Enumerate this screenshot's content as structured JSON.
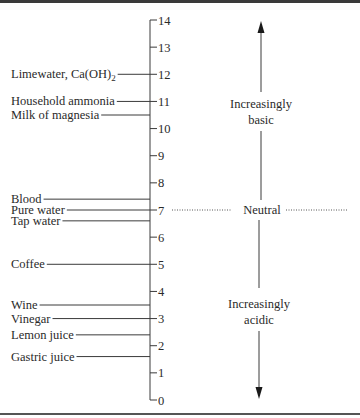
{
  "diagram": {
    "scale": {
      "min": 0,
      "max": 14,
      "ticks": [
        "14",
        "13",
        "12",
        "11",
        "10",
        "9",
        "8",
        "7",
        "6",
        "5",
        "4",
        "3",
        "2",
        "1",
        "0"
      ]
    },
    "substances": [
      {
        "name": "Limewater, Ca(OH)",
        "subscript": "2",
        "ph": 12
      },
      {
        "name": "Household ammonia",
        "ph": 11
      },
      {
        "name": "Milk of magnesia",
        "ph": 10.5
      },
      {
        "name": "Blood",
        "ph": 7.4
      },
      {
        "name": "Pure water",
        "ph": 7
      },
      {
        "name": "Tap water",
        "ph": 6.6
      },
      {
        "name": "Coffee",
        "ph": 5
      },
      {
        "name": "Wine",
        "ph": 3.5
      },
      {
        "name": "Vinegar",
        "ph": 3
      },
      {
        "name": "Lemon juice",
        "ph": 2.4
      },
      {
        "name": "Gastric juice",
        "ph": 1.6
      }
    ],
    "directions": {
      "basic": {
        "line1": "Increasingly",
        "line2": "basic"
      },
      "acidic": {
        "line1": "Increasingly",
        "line2": "acidic"
      }
    },
    "neutral": {
      "label": "Neutral",
      "ph": 7
    }
  }
}
